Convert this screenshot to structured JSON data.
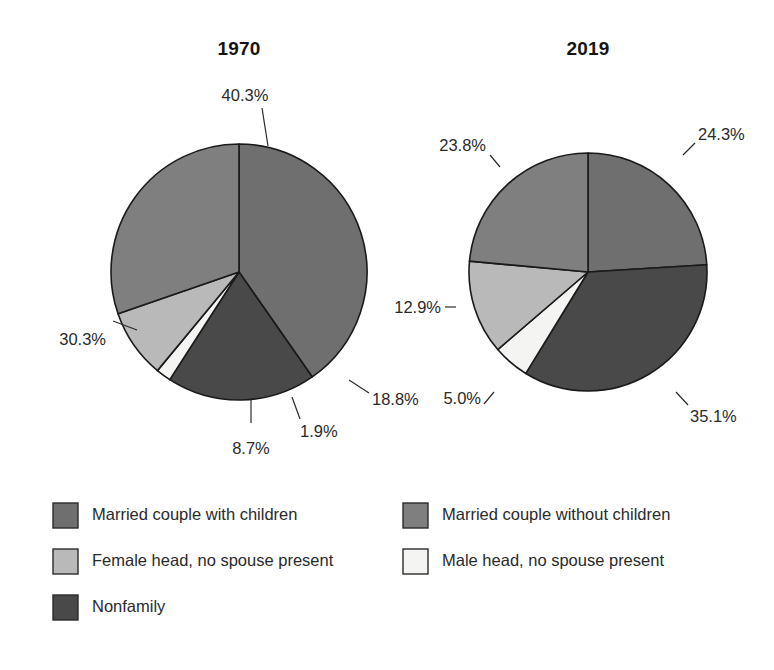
{
  "chart_data": [
    {
      "type": "pie",
      "title": "1970",
      "categories": [
        "Married couple with children",
        "Nonfamily",
        "Male head, no spouse present",
        "Female head, no spouse present",
        "Married couple without children"
      ],
      "values": [
        40.3,
        18.8,
        1.9,
        8.7,
        30.3
      ],
      "labels": [
        "40.3%",
        "18.8%",
        "1.9%",
        "8.7%",
        "30.3%"
      ],
      "start_angle_deg": 0,
      "direction": "clockwise",
      "xlabel": "",
      "ylabel": "",
      "legend_position": "bottom"
    },
    {
      "type": "pie",
      "title": "2019",
      "categories": [
        "Married couple with children",
        "Nonfamily",
        "Male head, no spouse present",
        "Female head, no spouse present",
        "Married couple without children"
      ],
      "values": [
        24.3,
        35.1,
        5.0,
        12.9,
        23.8
      ],
      "labels": [
        "24.3%",
        "35.1%",
        "5.0%",
        "12.9%",
        "23.8%"
      ],
      "start_angle_deg": 0,
      "direction": "clockwise",
      "xlabel": "",
      "ylabel": "",
      "legend_position": "bottom"
    }
  ],
  "titles": {
    "left": "1970",
    "right": "2019"
  },
  "pie_1970": {
    "slice_married_with_children": "40.3%",
    "slice_nonfamily": "18.8%",
    "slice_male_head": "1.9%",
    "slice_female_head": "8.7%",
    "slice_married_without_children": "30.3%"
  },
  "pie_2019": {
    "slice_married_with_children": "24.3%",
    "slice_nonfamily": "35.1%",
    "slice_male_head": "5.0%",
    "slice_female_head": "12.9%",
    "slice_married_without_children": "23.8%"
  },
  "legend": {
    "items": [
      {
        "label": "Married couple with children",
        "color": "#6f6f6f"
      },
      {
        "label": "Married couple without children",
        "color": "#7f7f7f"
      },
      {
        "label": "Female head, no spouse present",
        "color": "#b9b9b9"
      },
      {
        "label": "Male head, no spouse present",
        "color": "#f4f4f2"
      },
      {
        "label": "Nonfamily",
        "color": "#494949"
      }
    ]
  },
  "colors": {
    "married_with_children": "#6f6f6f",
    "married_without_children": "#7f7f7f",
    "female_head": "#b9b9b9",
    "male_head": "#f4f4f2",
    "nonfamily": "#494949",
    "outline": "#1a1a1a",
    "text": "#2a2a2a",
    "background": "#ffffff"
  }
}
